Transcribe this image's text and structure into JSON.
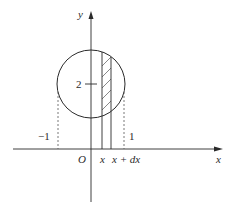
{
  "diagram": {
    "axes": {
      "x_label": "x",
      "y_label": "y",
      "origin_label": "O"
    },
    "labels": {
      "center_y_tick": "2",
      "left_bound": "−1",
      "right_bound": "1",
      "strip_left": "x",
      "strip_right": "x + dx"
    },
    "colors": {
      "stroke": "#2a2a2a",
      "dashed": "#555555",
      "background": "#ffffff"
    }
  }
}
